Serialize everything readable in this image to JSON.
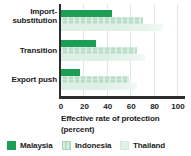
{
  "chart_data": {
    "type": "bar",
    "orientation": "horizontal",
    "title": "",
    "categories": [
      "Import-substitution",
      "Transition",
      "Export push"
    ],
    "series": [
      {
        "name": "Malaysia",
        "color": "#1c9e54",
        "values": [
          44,
          30,
          16
        ]
      },
      {
        "name": "Indonesia",
        "color": "#b9ddc7",
        "values": [
          70,
          65,
          58
        ]
      },
      {
        "name": "Thailand",
        "color": "#e2f2e9",
        "values": [
          87,
          72,
          65
        ]
      }
    ],
    "xlabel": "Effective rate of protection (percent)",
    "xlim": [
      0,
      100
    ],
    "xticks": [
      0,
      20,
      40,
      60,
      80,
      100
    ],
    "grid": true,
    "gridline_color": "#d9ecdf",
    "axis_color": "#2d2d2d",
    "legend_position": "bottom"
  },
  "labels": {
    "category_1_line1": "Import-",
    "category_1_line2": "substitution",
    "category_2": "Transition",
    "category_3": "Export push",
    "xlabel_line1": "Effective rate of protection",
    "xlabel_line2": "(percent)"
  }
}
